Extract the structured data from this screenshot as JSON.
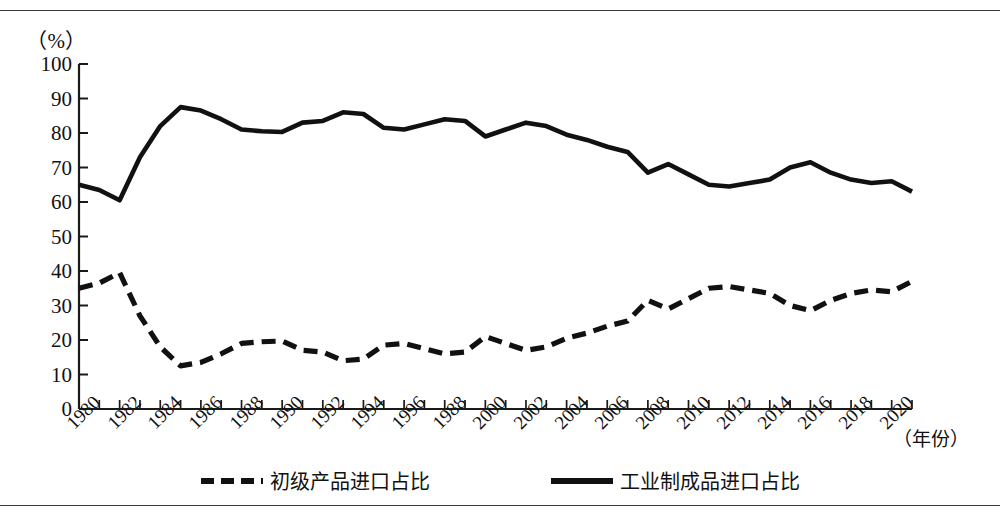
{
  "axis_unit_label": "（%）",
  "x_axis_title": "（年份）",
  "legend": {
    "items": [
      {
        "key": "primary",
        "label": "初级产品进口占比",
        "style": "dashed",
        "color": "#111111"
      },
      {
        "key": "manufactured",
        "label": "工业制成品进口占比",
        "style": "solid",
        "color": "#111111"
      }
    ]
  },
  "y_tick_labels": [
    "100",
    "90",
    "80",
    "70",
    "60",
    "50",
    "40",
    "30",
    "20",
    "10",
    "0"
  ],
  "x_tick_labels": [
    "1980",
    "1982",
    "1984",
    "1986",
    "1988",
    "1990",
    "1992",
    "1994",
    "1996",
    "1988",
    "2000",
    "2002",
    "2004",
    "2006",
    "2008",
    "2010",
    "2012",
    "2014",
    "2016",
    "2018",
    "2020"
  ],
  "chart_data": {
    "type": "line",
    "title": "",
    "subtitle": "",
    "xlabel": "（年份）",
    "ylabel": "（%）",
    "xlim": [
      1980,
      2021
    ],
    "ylim": [
      0,
      100
    ],
    "y_ticks": [
      0,
      10,
      20,
      30,
      40,
      50,
      60,
      70,
      80,
      90,
      100
    ],
    "x_ticks_major": [
      1980,
      1982,
      1984,
      1986,
      1988,
      1990,
      1992,
      1994,
      1996,
      1998,
      2000,
      2002,
      2004,
      2006,
      2008,
      2010,
      2012,
      2014,
      2016,
      2018,
      2020
    ],
    "x_tick_labels_as_drawn": [
      "1980",
      "1982",
      "1984",
      "1986",
      "1988",
      "1990",
      "1992",
      "1994",
      "1996",
      "1988",
      "2000",
      "2002",
      "2004",
      "2006",
      "2008",
      "2010",
      "2012",
      "2014",
      "2016",
      "2018",
      "2020"
    ],
    "x_minor_tick_interval": 1,
    "grid": false,
    "legend_position": "bottom-center",
    "x": [
      1980,
      1981,
      1982,
      1983,
      1984,
      1985,
      1986,
      1987,
      1988,
      1989,
      1990,
      1991,
      1992,
      1993,
      1994,
      1995,
      1996,
      1997,
      1998,
      1999,
      2000,
      2001,
      2002,
      2003,
      2004,
      2005,
      2006,
      2007,
      2008,
      2009,
      2010,
      2011,
      2012,
      2013,
      2014,
      2015,
      2016,
      2017,
      2018,
      2019,
      2020,
      2021
    ],
    "series": [
      {
        "name": "工业制成品进口占比",
        "style": "solid",
        "color": "#111111",
        "values": [
          65.0,
          63.5,
          60.5,
          73.0,
          82.0,
          87.5,
          86.5,
          84.0,
          81.0,
          80.5,
          80.3,
          83.0,
          83.5,
          86.0,
          85.5,
          81.5,
          81.0,
          82.5,
          84.0,
          83.5,
          79.0,
          81.0,
          83.0,
          82.0,
          79.5,
          78.0,
          76.0,
          74.5,
          68.5,
          71.0,
          68.0,
          65.0,
          64.5,
          65.5,
          66.5,
          70.0,
          71.5,
          68.5,
          66.5,
          65.5,
          66.0,
          63.0
        ]
      },
      {
        "name": "初级产品进口占比",
        "style": "dashed",
        "color": "#111111",
        "values": [
          35.0,
          36.5,
          39.5,
          27.0,
          18.0,
          12.5,
          13.5,
          16.0,
          19.0,
          19.5,
          19.7,
          17.0,
          16.5,
          14.0,
          14.5,
          18.5,
          19.0,
          17.5,
          16.0,
          16.5,
          21.0,
          19.0,
          17.0,
          18.0,
          20.5,
          22.0,
          24.0,
          25.5,
          31.5,
          29.0,
          32.0,
          35.0,
          35.5,
          34.5,
          33.5,
          30.0,
          28.5,
          31.5,
          33.5,
          34.5,
          34.0,
          37.0
        ]
      }
    ]
  }
}
